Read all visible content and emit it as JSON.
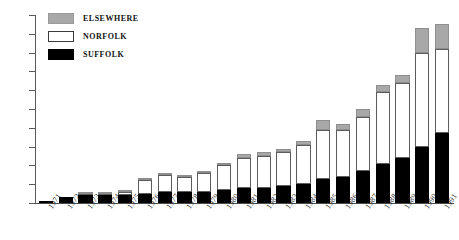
{
  "chart_data": {
    "type": "bar",
    "stacked": true,
    "title": "",
    "subtitle": "",
    "xlabel": "",
    "ylabel": "",
    "ylim": [
      0,
      100
    ],
    "yticks": [
      0,
      10,
      20,
      30,
      40,
      50,
      60,
      70,
      80,
      90,
      100
    ],
    "ytick_labels": [
      "0",
      "10",
      "20",
      "30",
      "40",
      "50",
      "60",
      "70",
      "80",
      "90",
      "100"
    ],
    "grid": false,
    "legend_position": "top-left",
    "categories": [
      "1971",
      "1972",
      "1973",
      "1974",
      "1975",
      "1976",
      "1977",
      "1978",
      "1979",
      "1980",
      "1981",
      "1982",
      "1983",
      "1984",
      "1985",
      "1986",
      "1987",
      "1988",
      "1989",
      "1990",
      "1991"
    ],
    "series": [
      {
        "name": "SUFFOLK",
        "color": "#000000",
        "values": [
          1,
          3,
          4,
          4,
          4,
          5,
          6,
          6,
          6,
          7,
          8,
          8,
          9,
          10,
          13,
          14,
          17,
          21,
          24,
          30,
          37
        ]
      },
      {
        "name": "NORFOLK",
        "color": "#ffffff",
        "values": [
          0,
          0,
          1,
          1,
          2,
          7,
          9,
          8,
          10,
          13,
          16,
          17,
          18,
          21,
          26,
          25,
          29,
          38,
          40,
          50,
          45
        ]
      },
      {
        "name": "ELSEWHERE",
        "color": "#a8a8a8",
        "values": [
          0,
          0,
          1,
          1,
          1,
          1,
          1,
          1,
          1,
          1,
          2,
          2,
          2,
          2,
          5,
          3,
          4,
          4,
          4,
          13,
          13
        ]
      }
    ],
    "totals": [
      1,
      3,
      6,
      6,
      7,
      13,
      16,
      15,
      17,
      21,
      26,
      27,
      29,
      33,
      44,
      42,
      50,
      63,
      68,
      93,
      95
    ]
  },
  "legend": {
    "items": [
      {
        "label": "ELSEWHERE",
        "swatch": "gray-swatch"
      },
      {
        "label": "NORFOLK",
        "swatch": "white-swatch"
      },
      {
        "label": "SUFFOLK",
        "swatch": "black-swatch"
      }
    ]
  }
}
